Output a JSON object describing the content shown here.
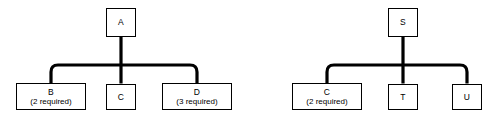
{
  "diagram": {
    "type": "product-structure-tree",
    "background_color": "#ffffff",
    "line_color": "#000000",
    "box_fill_color": "#ffffff",
    "box_border_color": "#000000",
    "trees": [
      {
        "id": "tree-a",
        "root": {
          "code": "A",
          "qty_label": ""
        },
        "children": [
          {
            "code": "B",
            "qty_label": "(2 required)"
          },
          {
            "code": "C",
            "qty_label": ""
          },
          {
            "code": "D",
            "qty_label": "(3 required)"
          }
        ]
      },
      {
        "id": "tree-s",
        "root": {
          "code": "S",
          "qty_label": ""
        },
        "children": [
          {
            "code": "C",
            "qty_label": "(2 required)"
          },
          {
            "code": "T",
            "qty_label": ""
          },
          {
            "code": "U",
            "qty_label": ""
          }
        ]
      }
    ]
  }
}
